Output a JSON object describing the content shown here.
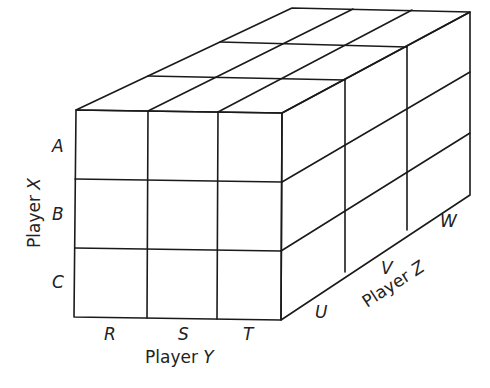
{
  "diagram": {
    "type": "3x3x3 cube game matrix",
    "players": {
      "x": {
        "label": "Player",
        "name": "X",
        "strategies": [
          "A",
          "B",
          "C"
        ]
      },
      "y": {
        "label": "Player",
        "name": "Y",
        "strategies": [
          "R",
          "S",
          "T"
        ]
      },
      "z": {
        "label": "Player",
        "name": "Z",
        "strategies": [
          "U",
          "V",
          "W"
        ]
      }
    },
    "colors": {
      "line": "#1a1a1a",
      "background": "#ffffff",
      "text": "#222222"
    }
  }
}
